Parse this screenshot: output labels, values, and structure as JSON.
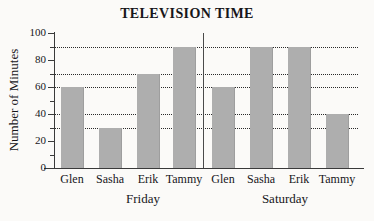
{
  "chart_data": {
    "type": "bar",
    "title": "TELEVISION TIME",
    "xlabel": "",
    "ylabel": "Number of Minutes",
    "ylim": [
      0,
      100
    ],
    "ytick_labels": [
      "0",
      "20",
      "40",
      "60",
      "80",
      "100"
    ],
    "ytick_values": [
      0,
      20,
      40,
      60,
      80,
      100
    ],
    "yminor_values": [
      10,
      30,
      50,
      70,
      90
    ],
    "grid": "horizontal-dotted-at-bar-values",
    "gridlines": [
      30,
      40,
      60,
      70,
      90
    ],
    "legend": "none",
    "categories": [
      "Glen",
      "Sasha",
      "Erik",
      "Tammy"
    ],
    "groups": [
      {
        "name": "Friday",
        "categories": [
          "Glen",
          "Sasha",
          "Erik",
          "Tammy"
        ],
        "values": [
          60,
          30,
          70,
          90
        ]
      },
      {
        "name": "Saturday",
        "categories": [
          "Glen",
          "Sasha",
          "Erik",
          "Tammy"
        ],
        "values": [
          60,
          90,
          90,
          40
        ]
      }
    ],
    "series": [
      {
        "name": "Friday",
        "values": [
          60,
          30,
          70,
          90
        ]
      },
      {
        "name": "Saturday",
        "values": [
          60,
          90,
          90,
          40
        ]
      }
    ],
    "bar_color": "#aeaeae",
    "axis_color": "#3a3a3a",
    "text_color": "#17161a",
    "background": "#fbfaf8"
  }
}
